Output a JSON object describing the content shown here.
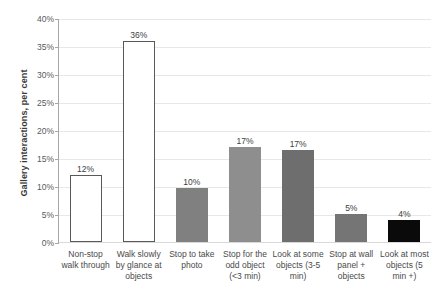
{
  "chart_data": {
    "type": "bar",
    "title": "",
    "xlabel": "",
    "ylabel": "Gallery interactions, per cent",
    "ylim": [
      0,
      40
    ],
    "ytick_labels": [
      "40%",
      "35%",
      "30%",
      "25%",
      "20%",
      "15%",
      "10%",
      "5%",
      "0%"
    ],
    "ytick_values": [
      40,
      35,
      30,
      25,
      20,
      15,
      10,
      5,
      0
    ],
    "grid": true,
    "legend": "none",
    "categories": [
      "Non-stop walk through",
      "Walk slowly by glance at objects",
      "Stop to take photo",
      "Stop for the odd object (<3 min)",
      "Look at some objects (3-5 min)",
      "Stop at wall panel + objects",
      "Look at most objects (5 min +)"
    ],
    "values": [
      12,
      36,
      10,
      17,
      17,
      5,
      4
    ],
    "value_labels": [
      "12%",
      "36%",
      "10%",
      "17%",
      "17%",
      "5%",
      "4%"
    ],
    "bar_heights_pct": [
      12,
      36,
      9.7,
      17,
      16.5,
      5,
      4
    ],
    "bar_colors": [
      "#ffffff",
      "#ffffff",
      "#808080",
      "#8e8e8e",
      "#6e6e6e",
      "#757575",
      "#0a0a0a"
    ],
    "bar_edge_colors": [
      "#595959",
      "#595959",
      "#808080",
      "#8e8e8e",
      "#6e6e6e",
      "#757575",
      "#0a0a0a"
    ]
  },
  "style": {
    "grid_color": "#e8e8e8",
    "axis_color": "#a6a6a6",
    "text_color": "#4a4a4a",
    "background": "#ffffff"
  }
}
